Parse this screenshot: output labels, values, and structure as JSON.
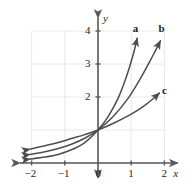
{
  "chart_data": {
    "type": "line",
    "title": "",
    "subtitle": "",
    "xlabel": "x",
    "ylabel": "y",
    "xlim": [
      -2.35,
      2.45
    ],
    "ylim": [
      -0.45,
      4.45
    ],
    "grid": true,
    "grid_x_range": [
      -2,
      2
    ],
    "grid_y_range": [
      0,
      4
    ],
    "legend": "inline-curve-labels",
    "x_ticks": [
      -2,
      -1,
      0,
      1,
      2
    ],
    "x_tick_labels": [
      "−2",
      "−1",
      "0",
      "1",
      "2"
    ],
    "y_ticks": [
      2,
      3,
      4
    ],
    "y_tick_labels": [
      "2",
      "3",
      "4"
    ],
    "annotations": [
      {
        "text": "a",
        "x": 1.05,
        "y": 4.25
      },
      {
        "text": "b",
        "x": 1.82,
        "y": 4.25
      },
      {
        "text": "c",
        "x": 1.93,
        "y": 2.35
      }
    ],
    "series": [
      {
        "name": "a",
        "label": "a",
        "color": "#4d4d4d",
        "arrow_start": true,
        "arrow_end": true,
        "points": [
          {
            "x": -2.05,
            "y": 0.12
          },
          {
            "x": -1.6,
            "y": 0.18
          },
          {
            "x": -1.2,
            "y": 0.26
          },
          {
            "x": -0.8,
            "y": 0.4
          },
          {
            "x": -0.4,
            "y": 0.62
          },
          {
            "x": 0.0,
            "y": 1.0
          },
          {
            "x": 0.3,
            "y": 1.4
          },
          {
            "x": 0.6,
            "y": 1.95
          },
          {
            "x": 0.85,
            "y": 2.6
          },
          {
            "x": 1.05,
            "y": 3.25
          },
          {
            "x": 1.18,
            "y": 3.78
          }
        ]
      },
      {
        "name": "b",
        "label": "b",
        "color": "#4d4d4d",
        "arrow_start": true,
        "arrow_end": true,
        "points": [
          {
            "x": -2.05,
            "y": 0.26
          },
          {
            "x": -1.6,
            "y": 0.34
          },
          {
            "x": -1.2,
            "y": 0.44
          },
          {
            "x": -0.8,
            "y": 0.57
          },
          {
            "x": -0.4,
            "y": 0.75
          },
          {
            "x": 0.0,
            "y": 1.0
          },
          {
            "x": 0.45,
            "y": 1.4
          },
          {
            "x": 0.9,
            "y": 1.95
          },
          {
            "x": 1.3,
            "y": 2.6
          },
          {
            "x": 1.65,
            "y": 3.25
          },
          {
            "x": 1.88,
            "y": 3.7
          }
        ]
      },
      {
        "name": "c",
        "label": "c",
        "color": "#4d4d4d",
        "arrow_start": true,
        "arrow_end": true,
        "points": [
          {
            "x": -2.05,
            "y": 0.42
          },
          {
            "x": -1.6,
            "y": 0.52
          },
          {
            "x": -1.2,
            "y": 0.62
          },
          {
            "x": -0.8,
            "y": 0.74
          },
          {
            "x": -0.4,
            "y": 0.86
          },
          {
            "x": 0.0,
            "y": 1.0
          },
          {
            "x": 0.5,
            "y": 1.22
          },
          {
            "x": 1.0,
            "y": 1.48
          },
          {
            "x": 1.4,
            "y": 1.74
          },
          {
            "x": 1.7,
            "y": 1.98
          },
          {
            "x": 1.85,
            "y": 2.12
          }
        ]
      }
    ],
    "colors": {
      "axis": "#58595b",
      "grid": "#e8e8ec",
      "curve": "#4d4d4d",
      "text": "#231f20",
      "background": "#ffffff"
    }
  }
}
